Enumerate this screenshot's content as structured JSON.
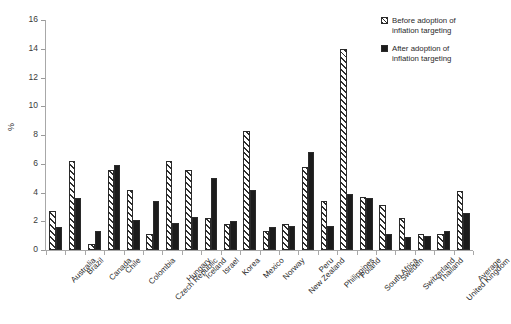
{
  "chart_data": {
    "type": "bar",
    "title": "",
    "subtitle": "",
    "xlabel": "",
    "ylabel": "%",
    "ylim": [
      0,
      16
    ],
    "ytick_step": 2,
    "yticks": [
      0,
      2,
      4,
      6,
      8,
      10,
      12,
      14,
      16
    ],
    "grid": false,
    "legend_position": "top-right",
    "orientation": "vertical",
    "categories": [
      "Australia",
      "Brazil",
      "Canada",
      "Chile",
      "Colombia",
      "Czech Republic",
      "Hungary",
      "Iceland",
      "Israel",
      "Korea",
      "Mexico",
      "Norway",
      "New Zealand",
      "Peru",
      "Philippines",
      "Poland",
      "South Africa",
      "Sweden",
      "Switzerland",
      "Thailand",
      "United Kingdom",
      "Average"
    ],
    "series": [
      {
        "name": "Before adoption of inflation targeting",
        "key": "before",
        "pattern": "diagonal-hatch",
        "color": "#2e2e2e",
        "values": [
          2.7,
          6.2,
          0.4,
          5.6,
          4.2,
          1.1,
          6.2,
          5.6,
          2.2,
          1.8,
          8.3,
          1.3,
          1.8,
          5.8,
          3.4,
          14.0,
          3.7,
          3.1,
          2.2,
          1.1,
          1.1,
          4.1
        ]
      },
      {
        "name": "After adoption of inflation targeting",
        "key": "after",
        "pattern": "solid",
        "color": "#1c1c1c",
        "values": [
          1.6,
          3.6,
          1.3,
          5.9,
          2.1,
          3.4,
          1.85,
          2.3,
          5.0,
          2.0,
          4.2,
          1.6,
          1.7,
          6.8,
          1.7,
          3.9,
          3.6,
          1.1,
          0.9,
          1.0,
          1.3,
          2.6
        ]
      }
    ]
  },
  "legend": {
    "items": [
      {
        "label_line1": "Before adoption of",
        "label_line2": "inflation targeting"
      },
      {
        "label_line1": "After adoption of",
        "label_line2": "inflation targeting"
      }
    ]
  }
}
